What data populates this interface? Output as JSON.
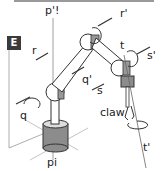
{
  "figure": {
    "panel_label": "E",
    "labels": {
      "p_top": "p'!",
      "p_bottom": "pi",
      "q": "q",
      "q_prime": "q'",
      "r": "r",
      "r_prime": "r'",
      "s": "s",
      "s_prime": "s'",
      "t": "t",
      "t_prime": "t'",
      "claw": "claw"
    },
    "colors": {
      "badge": "#3a3a3a",
      "joint_gray": "#8c8c8c",
      "outline": "#333333",
      "axis_line": "#888888"
    }
  }
}
